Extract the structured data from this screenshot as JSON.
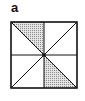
{
  "panel_label": "a",
  "figure": {
    "square": {
      "x": 11,
      "y": 22,
      "size": 66
    },
    "center_dot": true,
    "shaded_regions": [
      "top-left triangle (left of vertical midline, above main diagonal)",
      "bottom-right triangle (right of vertical midline, below main diagonal)"
    ],
    "colors": {
      "stroke": "#111111",
      "shade": "#bdbdbd"
    }
  }
}
